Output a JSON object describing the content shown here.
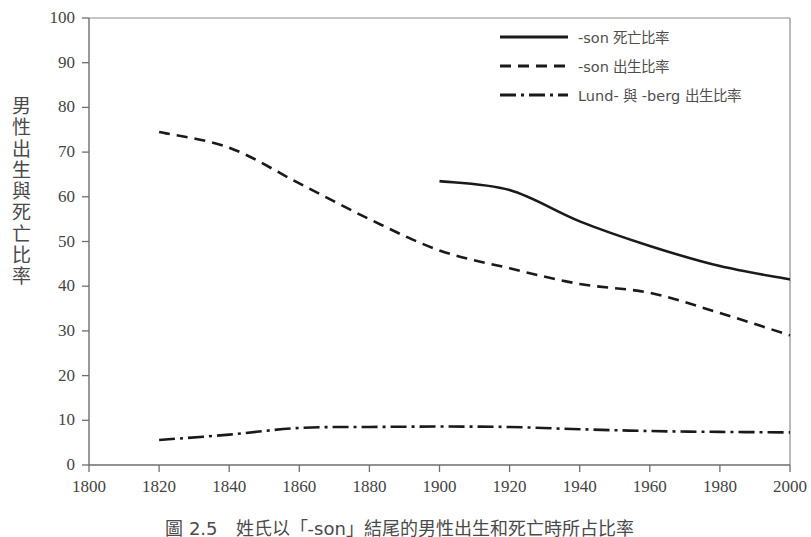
{
  "chart_data": {
    "type": "line",
    "title": "",
    "xlabel": "",
    "ylabel": "男性出生與死亡比率",
    "xlim": [
      1800,
      2000
    ],
    "ylim": [
      0,
      100
    ],
    "xticks": [
      1800,
      1820,
      1840,
      1860,
      1880,
      1900,
      1920,
      1940,
      1960,
      1980,
      2000
    ],
    "yticks": [
      0,
      10,
      20,
      30,
      40,
      50,
      60,
      70,
      80,
      90,
      100
    ],
    "grid": false,
    "legend_position": "top-right",
    "series": [
      {
        "name": "-son 死亡比率",
        "style": "solid",
        "color": "#1a1a1a",
        "x": [
          1900,
          1920,
          1940,
          1960,
          1980,
          2000
        ],
        "values": [
          63.5,
          61.5,
          54.5,
          49.0,
          44.5,
          41.5
        ]
      },
      {
        "name": "-son 出生比率",
        "style": "dashed",
        "color": "#1a1a1a",
        "x": [
          1820,
          1840,
          1860,
          1880,
          1900,
          1920,
          1940,
          1960,
          1980,
          2000
        ],
        "values": [
          74.5,
          71.0,
          63.0,
          55.0,
          48.0,
          44.0,
          40.5,
          38.5,
          34.0,
          29.0
        ]
      },
      {
        "name": "Lund- 與 -berg 出生比率",
        "style": "dashdot",
        "color": "#1a1a1a",
        "x": [
          1820,
          1840,
          1860,
          1880,
          1900,
          1920,
          1940,
          1960,
          1980,
          2000
        ],
        "values": [
          5.6,
          6.8,
          8.3,
          8.5,
          8.6,
          8.5,
          8.0,
          7.6,
          7.4,
          7.3
        ]
      }
    ]
  },
  "axis": {
    "y_tick_labels": [
      "100",
      "90",
      "80",
      "70",
      "60",
      "50",
      "40",
      "30",
      "20",
      "10",
      "0"
    ],
    "x_tick_labels": [
      "1800",
      "1820",
      "1840",
      "1860",
      "1880",
      "1900",
      "1920",
      "1940",
      "1960",
      "1980",
      "2000"
    ],
    "y_axis_title": "男\n性\n出\n生\n與\n死\n亡\n比\n率"
  },
  "legend": {
    "items": [
      {
        "label": "-son 死亡比率",
        "style": "solid"
      },
      {
        "label": "-son 出生比率",
        "style": "dashed"
      },
      {
        "label": "Lund- 與 -berg 出生比率",
        "style": "dashdot"
      }
    ]
  },
  "caption": {
    "text": "圖 2.5　姓氏以「-son」結尾的男性出生和死亡時所占比率"
  },
  "colors": {
    "line": "#1a1a1a",
    "axis": "#6e6e6e",
    "text": "#444444",
    "background": "#ffffff"
  }
}
